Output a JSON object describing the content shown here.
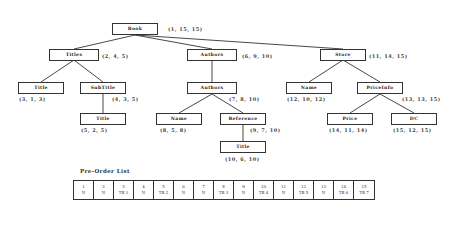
{
  "tree": {
    "nodes": [
      {
        "id": "book",
        "label": "Book",
        "triple": "(1, 15, 15)"
      },
      {
        "id": "titles",
        "label": "Titles",
        "triple": "(2, 4, 5)"
      },
      {
        "id": "title1",
        "label": "Title",
        "triple": "(3, 1, 3)"
      },
      {
        "id": "subtitle",
        "label": "SubTitle",
        "triple": "(4, 3, 5)"
      },
      {
        "id": "title2",
        "label": "Title",
        "triple": "(5, 2, 5)"
      },
      {
        "id": "authors1",
        "label": "Authors",
        "triple": "(6, 9, 10)"
      },
      {
        "id": "authors2",
        "label": "Authors",
        "triple": "(7, 8, 10)"
      },
      {
        "id": "name1",
        "label": "Name",
        "triple": "(8, 5, 8)"
      },
      {
        "id": "reference",
        "label": "Reference",
        "triple": "(9, 7, 10)"
      },
      {
        "id": "title3",
        "label": "Title",
        "triple": "(10, 6, 10)"
      },
      {
        "id": "store",
        "label": "Store",
        "triple": "(11, 14, 15)"
      },
      {
        "id": "name2",
        "label": "Name",
        "triple": "(12, 10, 12)"
      },
      {
        "id": "priceinfo",
        "label": "PriceInfo",
        "triple": "(13, 13, 15)"
      },
      {
        "id": "price",
        "label": "Price",
        "triple": "(14, 11, 14)"
      },
      {
        "id": "dc",
        "label": "DC",
        "triple": "(15, 12, 15)"
      }
    ],
    "edges": [
      [
        "book",
        "titles"
      ],
      [
        "book",
        "authors1"
      ],
      [
        "book",
        "store"
      ],
      [
        "titles",
        "title1"
      ],
      [
        "titles",
        "subtitle"
      ],
      [
        "subtitle",
        "title2"
      ],
      [
        "authors1",
        "authors2"
      ],
      [
        "authors2",
        "name1"
      ],
      [
        "authors2",
        "reference"
      ],
      [
        "reference",
        "title3"
      ],
      [
        "store",
        "name2"
      ],
      [
        "store",
        "priceinfo"
      ],
      [
        "priceinfo",
        "price"
      ],
      [
        "priceinfo",
        "dc"
      ]
    ]
  },
  "preorder": {
    "title": "Pre-Order List",
    "cells": [
      {
        "num": "1",
        "tag": "N"
      },
      {
        "num": "2",
        "tag": "N"
      },
      {
        "num": "3",
        "tag": "TB 1"
      },
      {
        "num": "4",
        "tag": "N"
      },
      {
        "num": "5",
        "tag": "TB 2"
      },
      {
        "num": "6",
        "tag": "N"
      },
      {
        "num": "7",
        "tag": "N"
      },
      {
        "num": "8",
        "tag": "TB 3"
      },
      {
        "num": "9",
        "tag": "N"
      },
      {
        "num": "10",
        "tag": "TB 4"
      },
      {
        "num": "11",
        "tag": "N"
      },
      {
        "num": "12",
        "tag": "TB 5"
      },
      {
        "num": "13",
        "tag": "N"
      },
      {
        "num": "14",
        "tag": "TB 6"
      },
      {
        "num": "15",
        "tag": "TB 7"
      }
    ]
  }
}
